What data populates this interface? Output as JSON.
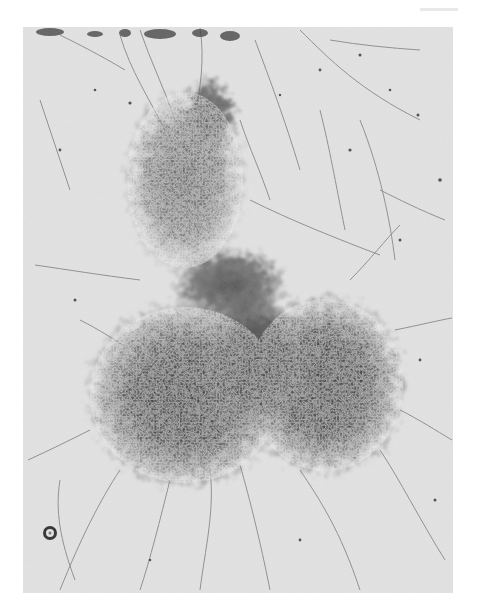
{
  "image": {
    "description": "Grayscale light micrograph of a dense branching filamentous colony forming a clover-like cluster with a smaller upper lobe and two large dark lower lobes, surrounded by thin radiating hyphae and scattered particles",
    "colors": {
      "page_background": "#ffffff",
      "photo_background": "#e4e4e4",
      "dense_core": "#3a3a3a",
      "filaments": "#6a6a6a",
      "particles": "#4a4a4a"
    },
    "frame": {
      "left": 23,
      "top": 27,
      "width": 430,
      "height": 566
    },
    "features": [
      {
        "name": "upper-lobe",
        "cx": 185,
        "cy": 180,
        "rx": 62,
        "ry": 95
      },
      {
        "name": "lower-left-lobe",
        "cx": 185,
        "cy": 395,
        "rx": 95,
        "ry": 90
      },
      {
        "name": "lower-right-lobe",
        "cx": 325,
        "cy": 385,
        "rx": 75,
        "ry": 85
      },
      {
        "name": "ring-particle",
        "cx": 50,
        "cy": 533,
        "r": 6
      }
    ]
  }
}
